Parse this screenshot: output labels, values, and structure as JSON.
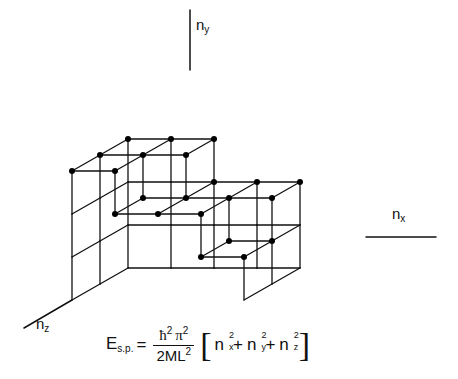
{
  "figure": {
    "background": "#ffffff",
    "line_color": "#111111",
    "dot_color": "#000000",
    "line_width": 1.3,
    "dot_radius": 3.0
  },
  "axes": {
    "y": {
      "label_base": "n",
      "label_sub": "y",
      "name": "n_y",
      "line": {
        "x1": 190,
        "y1": 10,
        "x2": 190,
        "y2": 70
      }
    },
    "x": {
      "label_base": "n",
      "label_sub": "x",
      "name": "n_x",
      "line": {
        "x1": 366,
        "y1": 237,
        "x2": 436,
        "y2": 237
      }
    },
    "z": {
      "label_base": "n",
      "label_sub": "z",
      "name": "n_z",
      "line": {
        "x1": 72,
        "y1": 300,
        "x2": 24,
        "y2": 328
      }
    }
  },
  "formula": {
    "lhs_base": "E",
    "lhs_sub": "s.p.",
    "equals": "=",
    "numerator_hbar": "ħ",
    "numerator_hbar_sup": "2",
    "numerator_pi": "π",
    "numerator_pi_sup": "2",
    "denominator": "2ML",
    "denominator_sup": "2",
    "bracket_open": "[",
    "bracket_close": "]",
    "terms": [
      {
        "base": "n",
        "sub": "x",
        "sup": "2"
      },
      {
        "base": "n",
        "sub": "y",
        "sup": "2"
      },
      {
        "base": "n",
        "sub": "z",
        "sup": "2"
      }
    ],
    "plus": "+",
    "plain_text": "E_s.p. = ħ²π² / 2ML² [ n²_x + n²_y + n²_z ]"
  },
  "lattice": {
    "description": "Isometric staircase of unit cubes; column heights decrease with x and z",
    "cube_size": 43,
    "depth_dx": 28,
    "depth_dy": -16,
    "origin": {
      "x": 72,
      "y": 300
    },
    "nx_columns": 4,
    "nz_rows": 2,
    "heights": [
      [
        3,
        3
      ],
      [
        3,
        2
      ],
      [
        2,
        2
      ],
      [
        2,
        1
      ]
    ],
    "step_profile": "3,3,2,2 front row descending to the right"
  }
}
